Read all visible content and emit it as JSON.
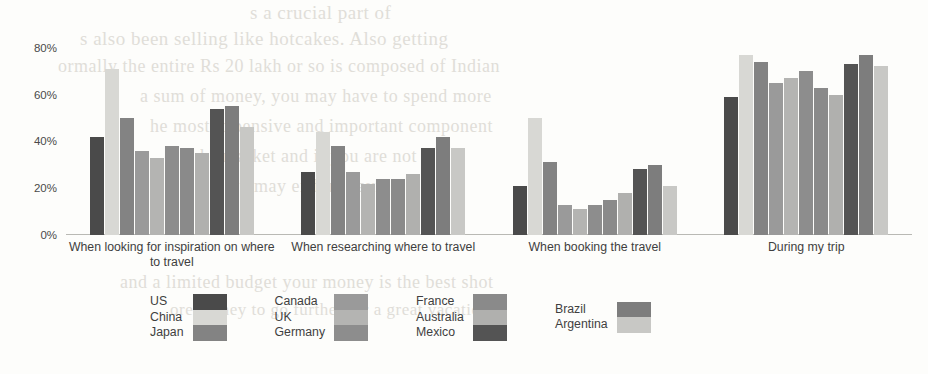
{
  "chart_data": {
    "type": "bar",
    "title": "",
    "subtitle": "",
    "xlabel": "",
    "ylabel": "",
    "ylim": [
      0,
      85
    ],
    "yticks": [
      "0%",
      "20%",
      "40%",
      "60%",
      "80%"
    ],
    "ytick_values": [
      0,
      20,
      40,
      60,
      80
    ],
    "grid": false,
    "legend_position": "bottom",
    "orientation": "vertical",
    "value_format": "percent",
    "categories": [
      "When looking for inspiration on where to travel",
      "When researching where to travel",
      "When booking the travel",
      "During my trip"
    ],
    "series": [
      {
        "name": "US",
        "color": "#4a4a4a",
        "values": [
          42,
          27,
          21,
          59
        ]
      },
      {
        "name": "China",
        "color": "#d8d8d4",
        "values": [
          71,
          44,
          50,
          77
        ]
      },
      {
        "name": "Japan",
        "color": "#838383",
        "values": [
          50,
          38,
          31,
          74
        ]
      },
      {
        "name": "Canada",
        "color": "#9a9a9a",
        "values": [
          36,
          27,
          13,
          65
        ]
      },
      {
        "name": "UK",
        "color": "#b4b4b2",
        "values": [
          33,
          22,
          11,
          67
        ]
      },
      {
        "name": "Germany",
        "color": "#8d8d8d",
        "values": [
          38,
          24,
          13,
          70
        ]
      },
      {
        "name": "France",
        "color": "#8a8a8a",
        "values": [
          37,
          24,
          15,
          63
        ]
      },
      {
        "name": "Australia",
        "color": "#b0b0ae",
        "values": [
          35,
          26,
          18,
          60
        ]
      },
      {
        "name": "Mexico",
        "color": "#545454",
        "values": [
          54,
          37,
          28,
          73
        ]
      },
      {
        "name": "Brazil",
        "color": "#7d7d7d",
        "values": [
          55,
          42,
          30,
          77
        ]
      },
      {
        "name": "Argentina",
        "color": "#c8c8c5",
        "values": [
          46,
          37,
          21,
          72
        ]
      }
    ]
  },
  "legend": {
    "columns": [
      {
        "names": [
          "US",
          "China",
          "Japan"
        ],
        "colors": [
          "#4a4a4a",
          "#d8d8d4",
          "#838383"
        ]
      },
      {
        "names": [
          "Canada",
          "UK",
          "Germany"
        ],
        "colors": [
          "#9a9a9a",
          "#b4b4b2",
          "#8d8d8d"
        ]
      },
      {
        "names": [
          "France",
          "Australia",
          "Mexico"
        ],
        "colors": [
          "#8a8a8a",
          "#b0b0ae",
          "#545454"
        ]
      },
      {
        "names": [
          "Brazil",
          "Argentina"
        ],
        "colors": [
          "#7d7d7d",
          "#c8c8c5"
        ]
      }
    ]
  },
  "background_text": [
    {
      "text": "s a crucial part of",
      "x": 250,
      "y": 2,
      "size": 19
    },
    {
      "text": "s also been selling like hotcakes. Also getting",
      "x": 80,
      "y": 28,
      "size": 19
    },
    {
      "text": "ormally the entire Rs 20 lakh or so is composed of Indian",
      "x": 58,
      "y": 56,
      "size": 18
    },
    {
      "text": "a sum of money, you may have to spend more",
      "x": 140,
      "y": 86,
      "size": 18
    },
    {
      "text": "he most expensive and important component",
      "x": 150,
      "y": 116,
      "size": 18
    },
    {
      "text": "he market and if you are not",
      "x": 200,
      "y": 146,
      "size": 18
    },
    {
      "text": "ou may end up paying",
      "x": 230,
      "y": 176,
      "size": 18
    },
    {
      "text": "and a limited budget your money is the best shot",
      "x": 120,
      "y": 272,
      "size": 18
    },
    {
      "text": "ore money to go further for a great vacation",
      "x": 170,
      "y": 300,
      "size": 17
    }
  ]
}
